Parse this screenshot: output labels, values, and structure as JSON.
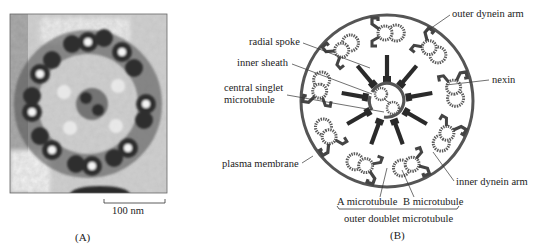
{
  "figure": {
    "panel_a": {
      "letter": "(A)",
      "type": "electron micrograph of axoneme cross-section",
      "scale_bar": {
        "label": "100 nm"
      }
    },
    "panel_b": {
      "letter": "(B)",
      "type": "schematic of 9+2 axoneme cross-section",
      "labels": {
        "radial_spoke": "radial spoke",
        "inner_sheath": "inner sheath",
        "central_singlet_line1": "central singlet",
        "central_singlet_line2": "microtubule",
        "plasma_membrane": "plasma membrane",
        "outer_dynein_arm": "outer dynein arm",
        "nexin": "nexin",
        "inner_dynein_arm": "inner dynein arm",
        "a_microtubule": "A microtubule",
        "b_microtubule": "B microtubule",
        "outer_doublet": "outer doublet microtubule"
      },
      "doublet_count": 9,
      "central_singlet_count": 2
    },
    "colors": {
      "membrane": "#555555",
      "dark_structure": "#2a2a2a",
      "tubule_dots": "#5a5a5a",
      "leader_line": "#333333"
    }
  }
}
